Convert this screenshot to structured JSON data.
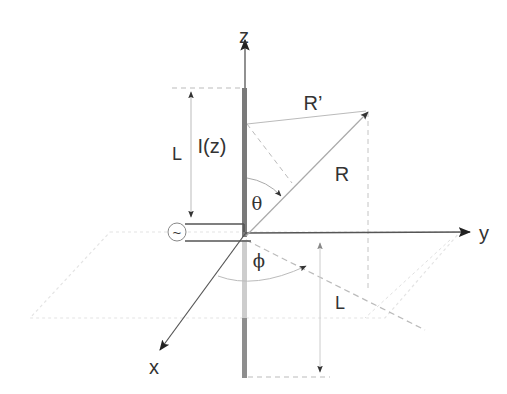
{
  "labels": {
    "z_axis": "z",
    "y_axis": "y",
    "x_axis": "x",
    "current": "I(z)",
    "length_upper": "L",
    "length_lower": "L",
    "distance_r": "R",
    "distance_r_prime": "R’",
    "theta": "θ",
    "phi": "ϕ",
    "source_symbol": "~"
  },
  "colors": {
    "axis": "#333333",
    "antenna": "#777777",
    "image_antenna_faded": "#c8c8c8",
    "image_antenna": "#8a8a8a",
    "guide": "#bbbbbb",
    "ground_plane": "#e6e6e6",
    "arrowhead": "#222222"
  },
  "elements": {
    "source": "ac-voltage-source-icon",
    "ground": "ground-plane"
  }
}
